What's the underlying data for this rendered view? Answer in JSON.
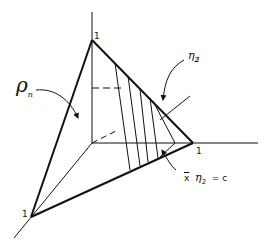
{
  "labels": {
    "vertex_top": "1",
    "vertex_right": "1",
    "vertex_left": "1",
    "rho": "ρ",
    "rho_sub": "n",
    "eta": "η",
    "eta_sub": "2",
    "equation_x": "x",
    "equation_eta": "η",
    "equation_sub": "2",
    "equation_rest": "= c"
  }
}
